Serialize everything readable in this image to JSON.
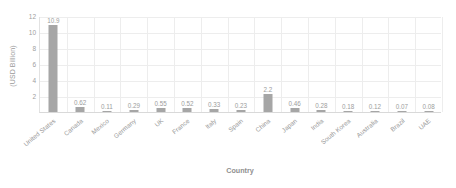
{
  "chart_data": {
    "type": "bar",
    "title": "",
    "xlabel": "Country",
    "ylabel": "(USD Billion)",
    "ylim": [
      0,
      12
    ],
    "yticks": [
      0,
      2,
      4,
      6,
      8,
      10,
      12
    ],
    "ytick_labels": [
      "0",
      "2",
      "4",
      "6",
      "8",
      "10",
      "12"
    ],
    "grid": true,
    "legend": false,
    "bar_color": "#a6a6a6",
    "grid_color": "#ededed",
    "axis_color": "#d9d9d9",
    "categories": [
      "United States",
      "Canada",
      "Mexico",
      "Germany",
      "UK",
      "France",
      "Italy",
      "Spain",
      "China",
      "Japan",
      "India",
      "South Korea",
      "Australia",
      "Brazil",
      "UAE"
    ],
    "values": [
      10.9,
      0.62,
      0.11,
      0.29,
      0.55,
      0.52,
      0.33,
      0.23,
      2.2,
      0.46,
      0.28,
      0.18,
      0.12,
      0.07,
      0.08
    ],
    "value_labels": [
      "10.9",
      "0.62",
      "0.11",
      "0.29",
      "0.55",
      "0.52",
      "0.33",
      "0.23",
      "2.2",
      "0.46",
      "0.28",
      "0.18",
      "0.12",
      "0.07",
      "0.08"
    ]
  }
}
